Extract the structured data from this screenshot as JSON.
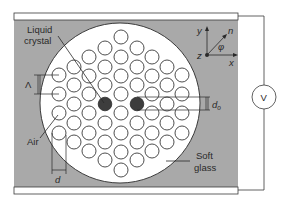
{
  "figure": {
    "type": "photonic crystal fiber cross-section between electrodes",
    "colors": {
      "background": "#ffffff",
      "soft_glass_region": "#a9a9a9",
      "fiber_cladding": "#ffffff",
      "air_hole_fill": "#ffffff",
      "air_hole_stroke": "#3a3a3a",
      "liquid_crystal_fill": "#3d3d3d",
      "line": "#2a2a2a"
    },
    "labels": {
      "liquid_crystal_line1": "Liquid",
      "liquid_crystal_line2": "crystal",
      "air": "Air",
      "soft_glass_line1": "Soft",
      "soft_glass_line2": "glass",
      "pitch": "Λ",
      "hole_diameter": "d",
      "lc_hole_diameter": "d",
      "lc_hole_diameter_sub": "o",
      "voltage": "V"
    },
    "axes": {
      "x": "x",
      "y": "y",
      "z": "z",
      "n": "n",
      "angle": "φ"
    },
    "hole_grid": {
      "columns_x": [
        59,
        74,
        89,
        105,
        121,
        137,
        152,
        167,
        182
      ],
      "liquid_crystal_holes": [
        [
          105,
          104
        ],
        [
          137,
          104
        ]
      ]
    }
  }
}
